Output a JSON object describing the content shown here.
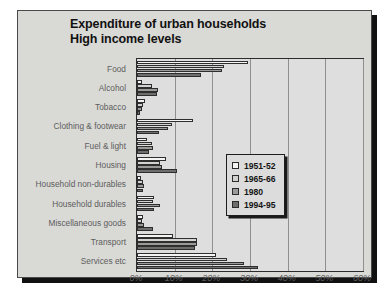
{
  "chart_data": {
    "type": "bar",
    "orientation": "horizontal",
    "title": "Expenditure of urban households",
    "subtitle": "High income levels",
    "title_lines": [
      "Expenditure of urban households",
      "High income levels"
    ],
    "xlabel": "",
    "ylabel": "",
    "xlim": [
      0,
      60
    ],
    "xticks": [
      0,
      10,
      20,
      30,
      40,
      50,
      60
    ],
    "xticklabels": [
      "0%",
      "10%",
      "20%",
      "30%",
      "40%",
      "50%",
      "60%"
    ],
    "grid": "vertical",
    "legend_position": "center-right",
    "categories": [
      "Food",
      "Alcohol",
      "Tobacco",
      "Clothing & footwear",
      "Fuel & light",
      "Housing",
      "Household non-durables",
      "Household durables",
      "Miscellaneous goods",
      "Transport",
      "Services etc"
    ],
    "series": [
      {
        "name": "1951-52",
        "color": "#f4f4f2",
        "values": [
          29.5,
          1.2,
          2.0,
          14.9,
          2.6,
          7.6,
          1.0,
          4.4,
          1.6,
          9.5,
          21.0
        ]
      },
      {
        "name": "1965-66",
        "color": "#d2d2d0",
        "values": [
          23.0,
          4.0,
          1.5,
          9.4,
          4.0,
          6.2,
          1.6,
          4.2,
          1.2,
          15.9,
          23.9
        ]
      },
      {
        "name": "1980",
        "color": "#9a9a98",
        "values": [
          22.6,
          5.5,
          1.4,
          8.3,
          4.2,
          6.6,
          1.9,
          6.0,
          1.8,
          15.8,
          28.4
        ]
      },
      {
        "name": "1994-95",
        "color": "#6e6e6c",
        "values": [
          17.0,
          5.3,
          0.9,
          5.9,
          3.2,
          10.5,
          1.5,
          4.4,
          4.2,
          15.3,
          32.0
        ]
      }
    ]
  }
}
